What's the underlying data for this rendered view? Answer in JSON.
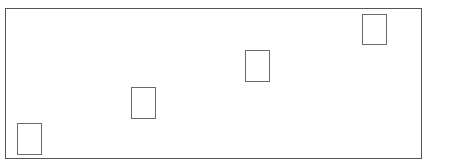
{
  "diagram": {
    "frame": {
      "left": 5,
      "top": 8,
      "width": 419,
      "height": 153,
      "border_color": "#555555"
    },
    "boxes": [
      {
        "id": "box-1",
        "left": 17,
        "top": 123,
        "width": 25,
        "height": 32
      },
      {
        "id": "box-2",
        "left": 131,
        "top": 87,
        "width": 25,
        "height": 32
      },
      {
        "id": "box-3",
        "left": 245,
        "top": 50,
        "width": 25,
        "height": 32
      },
      {
        "id": "box-4",
        "left": 362,
        "top": 14,
        "width": 25,
        "height": 31
      }
    ],
    "box_border_color": "#6a6a6a"
  }
}
